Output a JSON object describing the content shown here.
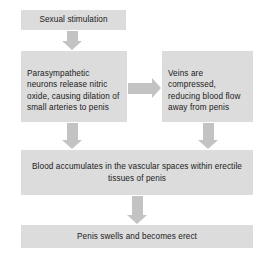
{
  "diagram": {
    "colors": {
      "background": "#ffffff",
      "node_fill": "#dcdcdc",
      "arrow_fill": "#c3c3c3",
      "text": "#1a1a1a"
    },
    "nodes": [
      {
        "id": "sexual-stimulation",
        "label": "Sexual stimulation"
      },
      {
        "id": "parasympathetic",
        "label": "Parasympathetic neurons release nitric oxide, causing dilation of small arteries to penis"
      },
      {
        "id": "veins",
        "label": "Veins are compressed, reducing blood flow away from penis"
      },
      {
        "id": "blood-accumulates",
        "label": "Blood accumulates in the vascular spaces within erectile tissues of penis"
      },
      {
        "id": "penis-swells",
        "label": "Penis swells and becomes erect"
      }
    ],
    "edges": [
      {
        "id": "stim-to-para",
        "from": "sexual-stimulation",
        "to": "parasympathetic",
        "direction": "down"
      },
      {
        "id": "para-to-veins",
        "from": "parasympathetic",
        "to": "veins",
        "direction": "right"
      },
      {
        "id": "para-to-blood",
        "from": "parasympathetic",
        "to": "blood-accumulates",
        "direction": "down"
      },
      {
        "id": "veins-to-blood",
        "from": "veins",
        "to": "blood-accumulates",
        "direction": "down"
      },
      {
        "id": "blood-to-swells",
        "from": "blood-accumulates",
        "to": "penis-swells",
        "direction": "down"
      }
    ]
  }
}
